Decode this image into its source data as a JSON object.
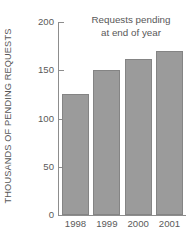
{
  "chart_data": {
    "type": "bar",
    "title": "Requests pending at end of year",
    "title_line1": "Requests pending",
    "title_line2": "at end of year",
    "xlabel": "",
    "ylabel": "THOUSANDS OF PENDING REQUESTS",
    "categories": [
      "1998",
      "1999",
      "2000",
      "2001"
    ],
    "values": [
      125,
      150,
      162,
      170
    ],
    "ylim": [
      0,
      200
    ],
    "yticks": [
      0,
      50,
      100,
      150,
      200
    ],
    "ytick_labels": [
      "0",
      "50",
      "100",
      "150",
      "200"
    ],
    "grid": false,
    "legend": null,
    "bar_color": "#9b9b9b",
    "bar_edge_color": "#848484",
    "axis_color": "#8d8d8d",
    "text_color": "#585858"
  }
}
